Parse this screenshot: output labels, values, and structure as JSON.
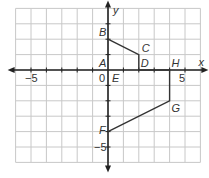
{
  "chart_data": {
    "type": "scatter",
    "title": "",
    "xlabel": "x",
    "ylabel": "y",
    "xlim": [
      -6,
      6
    ],
    "ylim": [
      -6,
      4
    ],
    "grid": true,
    "tick_labels": {
      "x": [
        {
          "value": -5,
          "text": "−5"
        },
        {
          "value": 0,
          "text": "0"
        },
        {
          "value": 5,
          "text": "5"
        }
      ],
      "y": [
        {
          "value": -5,
          "text": "−5"
        }
      ]
    },
    "points": [
      {
        "name": "A",
        "x": 0,
        "y": 0
      },
      {
        "name": "B",
        "x": 0,
        "y": 2
      },
      {
        "name": "C",
        "x": 2,
        "y": 1
      },
      {
        "name": "D",
        "x": 2,
        "y": 0
      },
      {
        "name": "E",
        "x": 0,
        "y": 0
      },
      {
        "name": "H",
        "x": 4,
        "y": 0
      },
      {
        "name": "G",
        "x": 4,
        "y": -2
      },
      {
        "name": "F",
        "x": 0,
        "y": -4
      }
    ],
    "polyline": [
      "B",
      "C",
      "D",
      "H",
      "G",
      "F"
    ],
    "colors": {
      "grid": "#c8c8c8",
      "axis": "#222222",
      "shape": "#333333",
      "text": "#333333"
    }
  }
}
